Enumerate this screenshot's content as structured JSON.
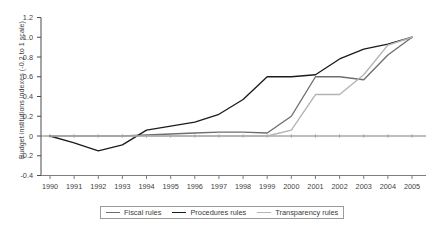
{
  "chart_data": {
    "type": "line",
    "title": "",
    "xlabel": "",
    "ylabel": "Budget institutions indexes (-0.2 to 1 scale)",
    "x": [
      1990,
      1991,
      1992,
      1993,
      1994,
      1995,
      1996,
      1997,
      1998,
      1999,
      2000,
      2001,
      2002,
      2003,
      2004,
      2005
    ],
    "xticklabels": [
      "1990",
      "1991",
      "1992",
      "1993",
      "1994",
      "1995",
      "1996",
      "1997",
      "1998",
      "1999",
      "2000",
      "2001",
      "2002",
      "2003",
      "2004",
      "2005"
    ],
    "yticklabels": [
      "-0.4",
      "-0.2",
      "0",
      "0.2",
      "0.4",
      "0.6",
      "0.8",
      "1.0",
      "1.2"
    ],
    "ytickvalues": [
      -0.4,
      -0.2,
      0,
      0.2,
      0.4,
      0.6,
      0.8,
      1.0,
      1.2
    ],
    "ylim": [
      -0.4,
      1.2
    ],
    "xlim": [
      1990,
      2005
    ],
    "grid": false,
    "legend_position": "bottom-center",
    "series": [
      {
        "name": "Fiscal rules",
        "color": "#6e6e6e",
        "values": [
          0.0,
          0.0,
          0.0,
          0.0,
          0.01,
          0.02,
          0.03,
          0.04,
          0.04,
          0.03,
          0.2,
          0.6,
          0.6,
          0.57,
          0.82,
          1.0
        ]
      },
      {
        "name": "Procedures rules",
        "color": "#1c1c1c",
        "values": [
          0.0,
          -0.07,
          -0.15,
          -0.09,
          0.06,
          0.1,
          0.14,
          0.22,
          0.37,
          0.6,
          0.6,
          0.62,
          0.78,
          0.88,
          0.93,
          1.0
        ]
      },
      {
        "name": "Transparency rules",
        "color": "#b3b3b3",
        "values": [
          0.0,
          0.0,
          0.0,
          0.0,
          0.0,
          0.0,
          0.0,
          0.0,
          0.0,
          0.0,
          0.06,
          0.42,
          0.42,
          0.62,
          0.92,
          1.0
        ]
      }
    ]
  }
}
